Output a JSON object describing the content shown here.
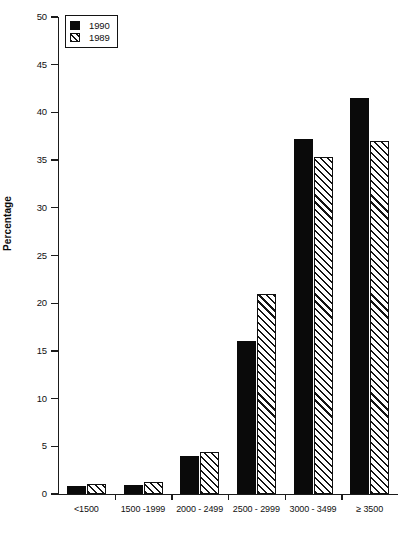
{
  "chart_data": {
    "type": "bar",
    "title": "",
    "xlabel": "",
    "ylabel": "Percentage",
    "ylim": [
      0,
      50
    ],
    "ytick_step": 5,
    "yticks": [
      0,
      5,
      10,
      15,
      20,
      25,
      30,
      35,
      40,
      45,
      50
    ],
    "ytick_labels": [
      "0",
      "5",
      "10",
      "15",
      "20",
      "25",
      "30",
      "35",
      "40",
      "45",
      "50"
    ],
    "grid": false,
    "legend_position": "top-left",
    "categories": [
      "<1500",
      "1500 -1999",
      "2000 - 2499",
      "2500 - 2999",
      "3000 - 3499",
      "≥ 3500"
    ],
    "series": [
      {
        "name": "1990",
        "style": "solid-black",
        "color": "#0a0a0a",
        "values": [
          0.8,
          0.9,
          4.0,
          16.0,
          37.2,
          41.5
        ]
      },
      {
        "name": "1989",
        "style": "hatched",
        "color": "#ffffff",
        "values": [
          1.1,
          1.3,
          4.4,
          21.0,
          35.3,
          37.0
        ]
      }
    ]
  },
  "legend": {
    "entries": [
      {
        "label": "1990",
        "swatch": "solid"
      },
      {
        "label": "1989",
        "swatch": "hatch"
      }
    ]
  },
  "axes": {
    "y_title": "Percentage"
  }
}
